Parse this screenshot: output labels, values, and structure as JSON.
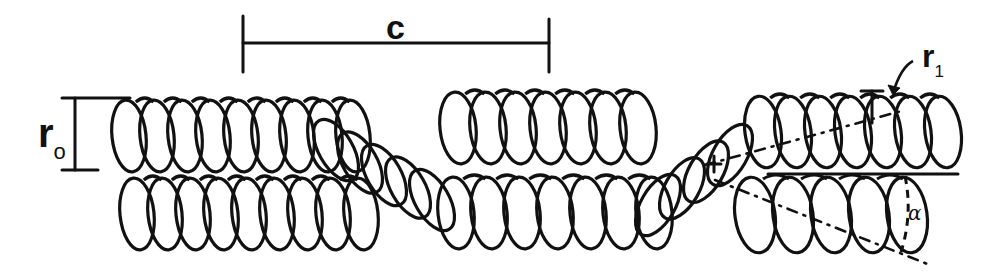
{
  "diagram": {
    "stroke_color": "#111111",
    "background_color": "#ffffff",
    "labels": {
      "pitch": "c",
      "major_radius_base": "r",
      "major_radius_sub": "o",
      "minor_radius_base": "r",
      "minor_radius_sub": "1",
      "angle": "α"
    },
    "pitch_bar": {
      "x1": 243,
      "x2": 549,
      "y": 43,
      "tick_half": 15
    },
    "r0_bracket": {
      "x": 75,
      "y_top": 98,
      "y_bottom": 170,
      "left": 62,
      "right_top": 130,
      "right_bottom": 98
    },
    "upper_coil_left": {
      "x_start": 112,
      "turns": 9,
      "spacing": 28,
      "cy": 136,
      "rx": 17,
      "ry": 36
    },
    "lower_coil_left": {
      "x_start": 120,
      "turns": 9,
      "spacing": 28,
      "cy": 214,
      "rx": 17,
      "ry": 36
    },
    "crossover_left": {
      "x_start": 318,
      "turns": 5,
      "spacing": 24,
      "cy_start": 150,
      "cy_end": 200
    },
    "upper_coil_mid": {
      "x_start": 440,
      "turns": 7,
      "spacing": 30,
      "cy": 128,
      "rx": 18,
      "ry": 36
    },
    "lower_coil_mid": {
      "x_start": 438,
      "turns": 7,
      "spacing": 33,
      "cy": 213,
      "rx": 18,
      "ry": 36
    },
    "crossover_right": {
      "x_start": 640,
      "turns": 4,
      "spacing": 24,
      "cy_start": 205,
      "cy_end": 155
    },
    "upper_coil_right": {
      "x_start": 745,
      "turns": 7,
      "spacing": 30,
      "cy": 132,
      "rx": 18,
      "ry": 36
    },
    "lower_coil_right": {
      "x_start": 735,
      "turns": 5,
      "spacing": 38,
      "cy": 215,
      "rx": 20,
      "ry": 38
    },
    "reference_line": {
      "x1": 768,
      "x2": 958,
      "y": 174
    },
    "upper_axis_dash": {
      "x1": 705,
      "y1": 165,
      "x2": 905,
      "y2": 110
    },
    "lower_axis_dash": {
      "x1": 715,
      "y1": 180,
      "x2": 930,
      "y2": 265
    },
    "angle_arc": {
      "x": 905,
      "y_top": 176,
      "y_bottom": 252
    },
    "r1_marker": {
      "x": 872,
      "y_top": 91,
      "y_bottom": 123,
      "cap_half": 11
    },
    "r1_arrow": {
      "from_x": 913,
      "from_y": 61,
      "to_x": 893,
      "to_y": 93
    },
    "plus_marker": {
      "x": 714,
      "y": 164
    }
  }
}
